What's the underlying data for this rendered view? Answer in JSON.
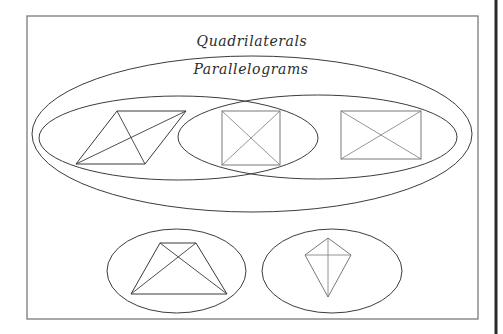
{
  "diagram": {
    "type": "venn-euler-classification",
    "labels": {
      "outer_set": "Quadrilaterals",
      "inner_set": "Parallelograms"
    },
    "sets": [
      {
        "name": "Quadrilaterals",
        "shape": "rectangle-frame"
      },
      {
        "name": "Parallelograms",
        "shape": "large-ellipse"
      },
      {
        "name": "Rhombuses",
        "shape": "left-ellipse",
        "unlabeled": true
      },
      {
        "name": "Rectangles",
        "shape": "right-ellipse",
        "unlabeled": true
      },
      {
        "name": "Trapezoids",
        "shape": "bottom-left-ellipse",
        "unlabeled": true
      },
      {
        "name": "Kites",
        "shape": "bottom-right-ellipse",
        "unlabeled": true
      }
    ],
    "figures": [
      {
        "name": "rhombus",
        "region": "rhombuses-only",
        "diagonals": true
      },
      {
        "name": "square",
        "region": "rhombuses-and-rectangles-overlap",
        "diagonals": true
      },
      {
        "name": "rectangle",
        "region": "rectangles-only",
        "diagonals": true
      },
      {
        "name": "trapezoid",
        "region": "trapezoids",
        "diagonals": true
      },
      {
        "name": "kite",
        "region": "kites",
        "diagonals": true
      }
    ],
    "colors": {
      "background": "#ffffff",
      "stroke": "#3c3c3c",
      "frame": "#7a7a7a",
      "text": "#2b2b2b"
    }
  }
}
